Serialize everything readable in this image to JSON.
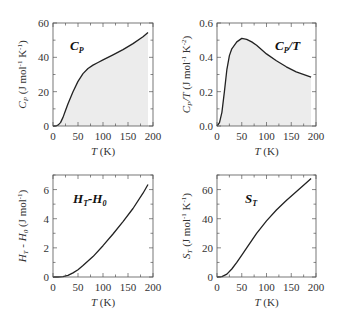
{
  "chart_data": [
    {
      "type": "area",
      "title": "C_P",
      "title_main": "C",
      "title_sub": "P",
      "xlabel": "T (K)",
      "ylabel": "C_P (J mol^-1 K^-1)",
      "xlim": [
        0,
        200
      ],
      "ylim": [
        0,
        60
      ],
      "xticks": [
        0,
        50,
        100,
        150,
        200
      ],
      "yticks": [
        0,
        20,
        40,
        60
      ],
      "x": [
        0,
        5,
        10,
        15,
        20,
        25,
        30,
        40,
        50,
        60,
        70,
        80,
        90,
        100,
        120,
        140,
        160,
        180,
        190
      ],
      "y": [
        0,
        0,
        0.5,
        2,
        5,
        9,
        13,
        20,
        26,
        30.5,
        33.5,
        35.5,
        37,
        38.5,
        41.5,
        44.5,
        48,
        52,
        54.5
      ],
      "fill": "#ececec"
    },
    {
      "type": "area",
      "title": "C_P/T",
      "xlabel": "T (K)",
      "ylabel": "C_P/T (J mol^-1 K^-2)",
      "xlim": [
        0,
        200
      ],
      "ylim": [
        0,
        0.6
      ],
      "xticks": [
        0,
        50,
        100,
        150,
        200
      ],
      "yticks": [
        "0.0",
        "0.2",
        "0.4",
        "0.6"
      ],
      "x": [
        0,
        5,
        10,
        15,
        20,
        25,
        30,
        40,
        50,
        60,
        70,
        80,
        100,
        120,
        140,
        160,
        180,
        190
      ],
      "y": [
        0,
        0.02,
        0.08,
        0.2,
        0.33,
        0.41,
        0.45,
        0.49,
        0.51,
        0.505,
        0.49,
        0.47,
        0.42,
        0.38,
        0.345,
        0.315,
        0.295,
        0.285
      ],
      "fill": "#ececec"
    },
    {
      "type": "line",
      "title": "H_T-H_0",
      "xlabel": "T (K)",
      "ylabel": "H_T - H_0 (J mol^-1)",
      "xlim": [
        0,
        200
      ],
      "ylim": [
        0,
        7
      ],
      "xticks": [
        0,
        50,
        100,
        150,
        200
      ],
      "yticks": [
        0,
        2,
        4,
        6
      ],
      "x": [
        0,
        10,
        20,
        30,
        40,
        50,
        60,
        80,
        100,
        120,
        140,
        160,
        180,
        190
      ],
      "y": [
        0,
        0,
        0.02,
        0.12,
        0.28,
        0.5,
        0.78,
        1.4,
        2.15,
        2.95,
        3.8,
        4.7,
        5.75,
        6.35
      ]
    },
    {
      "type": "line",
      "title": "S_T",
      "xlabel": "T (K)",
      "ylabel": "S_T (J mol^-1 K^-1)",
      "xlim": [
        0,
        200
      ],
      "ylim": [
        0,
        70
      ],
      "xticks": [
        0,
        50,
        100,
        150,
        200
      ],
      "yticks": [
        0,
        20,
        40,
        60
      ],
      "x": [
        0,
        10,
        20,
        30,
        40,
        50,
        60,
        80,
        100,
        120,
        140,
        160,
        180,
        190
      ],
      "y": [
        0,
        0.2,
        2,
        5.5,
        10,
        15,
        20,
        30,
        38.5,
        46,
        52.5,
        58.5,
        64.5,
        67.5
      ]
    }
  ],
  "panels": [
    {
      "label_main": "C",
      "label_sub": "P",
      "ylabel": "C",
      "ylabel_sub": "P",
      "ylabel_rest": " (J mol",
      "ylabel_sup1": "-1",
      "ylabel_mid": " K",
      "ylabel_sup2": "-1",
      "ylabel_end": ")",
      "xlabel_main": "T",
      "xlabel_rest": " (K)"
    },
    {
      "label_main": "C",
      "label_sub": "P",
      "label_rest": "/T",
      "ylabel": "C",
      "ylabel_sub": "P",
      "ylabel_slash": "/T",
      "ylabel_rest": " (J mol",
      "ylabel_sup1": "-1",
      "ylabel_mid": " K",
      "ylabel_sup2": "-2",
      "ylabel_end": ")",
      "xlabel_main": "T",
      "xlabel_rest": " (K)"
    },
    {
      "label_main": "H",
      "label_sub": "T",
      "label_mid": "-H",
      "label_sub2": "0",
      "ylabel": "H",
      "ylabel_sub": "T",
      "ylabel_mid": " - H",
      "ylabel_sub2": "0",
      "ylabel_rest": " (J mol",
      "ylabel_sup1": "-1",
      "ylabel_end": ")",
      "xlabel_main": "T",
      "xlabel_rest": " (K)"
    },
    {
      "label_main": "S",
      "label_sub": "T",
      "ylabel": "S",
      "ylabel_sub": "T",
      "ylabel_rest": " (J mol",
      "ylabel_sup1": "-1",
      "ylabel_mid": " K",
      "ylabel_sup2": "-1",
      "ylabel_end": ")",
      "xlabel_main": "T",
      "xlabel_rest": " (K)"
    }
  ]
}
